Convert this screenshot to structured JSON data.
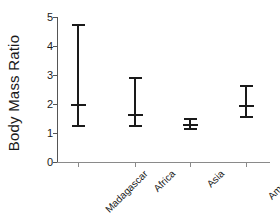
{
  "chart_data": {
    "type": "scatter",
    "title": "",
    "xlabel": "",
    "ylabel": "Body Mass Ratio",
    "categories": [
      "Madagascar",
      "Africa",
      "Asia",
      "America"
    ],
    "values": [
      1.97,
      1.62,
      1.28,
      1.93
    ],
    "error_low": [
      1.21,
      1.21,
      1.12,
      1.52
    ],
    "error_high": [
      4.76,
      2.93,
      1.52,
      2.66
    ],
    "ylim": [
      0,
      5
    ],
    "yticks": [
      0,
      1,
      2,
      3,
      4,
      5
    ],
    "ytick_labels": [
      "0",
      "1",
      "2",
      "3",
      "4",
      "5"
    ],
    "grid": false,
    "legend": null,
    "marker_style": "error-bar-with-mean-tick",
    "series_color": "#1a1a1a",
    "axis_color": "#555555",
    "background": "#ffffff"
  }
}
